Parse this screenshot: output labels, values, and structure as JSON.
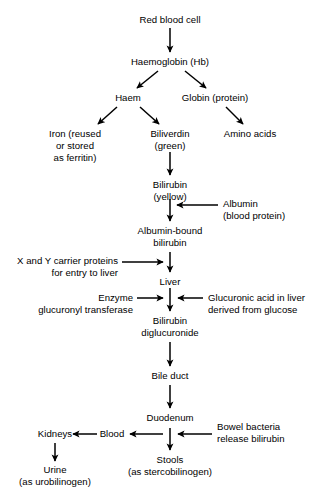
{
  "diagram": {
    "type": "flowchart",
    "background_color": "#ffffff",
    "text_color": "#000000",
    "arrow_color": "#000000",
    "nodes": {
      "red_blood_cell": {
        "line1": "Red blood cell"
      },
      "haemoglobin": {
        "line1": "Haemoglobin (Hb)"
      },
      "haem": {
        "line1": "Haem"
      },
      "globin": {
        "line1": "Globin (protein)"
      },
      "iron": {
        "line1": "Iron (reused",
        "line2": "or stored",
        "line3": "as ferritin)"
      },
      "biliverdin": {
        "line1": "Biliverdin",
        "line2": "(green)"
      },
      "amino_acids": {
        "line1": "Amino acids"
      },
      "bilirubin": {
        "line1": "Bilirubin",
        "line2": "(yellow)"
      },
      "albumin": {
        "line1": "Albumin",
        "line2": "(blood protein)"
      },
      "albumin_bound": {
        "line1": "Albumin-bound",
        "line2": "bilirubin"
      },
      "carrier_proteins": {
        "line1": "X and Y carrier proteins",
        "line2": "for entry to liver"
      },
      "liver": {
        "line1": "Liver"
      },
      "enzyme": {
        "line1": "Enzyme",
        "line2": "glucuronyl transferase"
      },
      "glucuronic_acid": {
        "line1": "Glucuronic acid in liver",
        "line2": "derived from glucose"
      },
      "bilirubin_diglucuronide": {
        "line1": "Bilirubin",
        "line2": "diglucuronide"
      },
      "bile_duct": {
        "line1": "Bile duct"
      },
      "duodenum": {
        "line1": "Duodenum"
      },
      "kidneys": {
        "line1": "Kidneys"
      },
      "blood": {
        "line1": "Blood"
      },
      "bowel_bacteria": {
        "line1": "Bowel bacteria",
        "line2": "release bilirubin"
      },
      "urine": {
        "line1": "Urine",
        "line2": "(as urobilinogen)"
      },
      "stools": {
        "line1": "Stools",
        "line2": "(as stercobilinogen)"
      }
    }
  }
}
